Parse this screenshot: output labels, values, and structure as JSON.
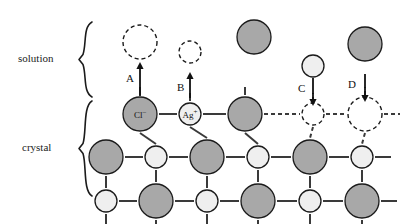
{
  "figure": {
    "background_color": "#ffffff",
    "regions": [
      {
        "id": "solution",
        "label": "solution",
        "label_x": 18,
        "label_y": 52,
        "brace_top": 22,
        "brace_bottom": 97,
        "brace_x": 92
      },
      {
        "id": "crystal",
        "label": "crystal",
        "label_x": 22,
        "label_y": 141,
        "brace_top": 101,
        "brace_bottom": 196,
        "brace_x": 92
      }
    ],
    "colors": {
      "anion_fill": "#a8a8a8",
      "cation_fill": "#efefef",
      "outline": "#1b1b1b",
      "bond": "#3a3a3a",
      "arrow": "#111111",
      "label_text": "#1b1b1b"
    },
    "ion_types": {
      "anion": {
        "name": "chloride",
        "formula": "Cl",
        "charge": "−",
        "radius": 17,
        "fill": "#a8a8a8"
      },
      "cation": {
        "name": "silver",
        "formula": "Ag",
        "charge": "+",
        "radius": 11,
        "fill": "#efefef"
      }
    },
    "ion_labels": [
      {
        "text_main": "Cl",
        "text_sup": "–",
        "x": 140,
        "y": 114
      },
      {
        "text_main": "Ag",
        "text_sup": "+",
        "x": 190,
        "y": 114
      }
    ],
    "arrows": [
      {
        "id": "A",
        "label": "A",
        "direction": "up",
        "x": 140,
        "y_from": 96,
        "y_to": 62,
        "label_x": 126,
        "label_y": 72
      },
      {
        "id": "B",
        "label": "B",
        "direction": "up",
        "x": 190,
        "y_from": 98,
        "y_to": 72,
        "label_x": 177,
        "label_y": 81
      },
      {
        "id": "C",
        "label": "C",
        "direction": "down",
        "x": 313,
        "y_from": 78,
        "y_to": 106,
        "label_x": 298,
        "label_y": 82
      },
      {
        "id": "D",
        "label": "D",
        "direction": "down",
        "x": 365,
        "y_from": 74,
        "y_to": 102,
        "label_x": 348,
        "label_y": 78
      }
    ],
    "solution_particles": [
      {
        "id": "a-target",
        "type": "anion",
        "cx": 140,
        "cy": 42,
        "style": "dashed",
        "r": 17
      },
      {
        "id": "b-target",
        "type": "cation",
        "cx": 190,
        "cy": 52,
        "style": "dashed",
        "r": 11
      },
      {
        "id": "free-anion",
        "type": "anion",
        "cx": 254,
        "cy": 37,
        "style": "solid",
        "r": 17
      },
      {
        "id": "c-source",
        "type": "cation",
        "cx": 313,
        "cy": 66,
        "style": "solid",
        "r": 11
      },
      {
        "id": "d-source",
        "type": "anion",
        "cx": 365,
        "cy": 44,
        "style": "solid",
        "r": 17
      }
    ],
    "lattice": {
      "rows": [
        {
          "y": 114,
          "sites": [
            {
              "col": 0,
              "x": 140,
              "type": "anion",
              "style": "solid"
            },
            {
              "col": 1,
              "x": 190,
              "type": "cation",
              "style": "solid"
            },
            {
              "col": 2,
              "x": 245,
              "type": "anion",
              "style": "solid"
            },
            {
              "col": 3,
              "x": 313,
              "type": "cation",
              "style": "dashed"
            },
            {
              "col": 4,
              "x": 365,
              "type": "anion",
              "style": "dashed"
            }
          ]
        },
        {
          "y": 157,
          "sites": [
            {
              "col": -1,
              "x": 106,
              "type": "anion",
              "style": "solid"
            },
            {
              "col": 0,
              "x": 156,
              "type": "cation",
              "style": "solid"
            },
            {
              "col": 1,
              "x": 207,
              "type": "anion",
              "style": "solid"
            },
            {
              "col": 2,
              "x": 258,
              "type": "cation",
              "style": "solid"
            },
            {
              "col": 3,
              "x": 310,
              "type": "anion",
              "style": "solid"
            },
            {
              "col": 4,
              "x": 362,
              "type": "cation",
              "style": "solid"
            }
          ]
        },
        {
          "y": 201,
          "sites": [
            {
              "col": -1,
              "x": 106,
              "type": "cation",
              "style": "solid"
            },
            {
              "col": 0,
              "x": 156,
              "type": "anion",
              "style": "solid"
            },
            {
              "col": 1,
              "x": 207,
              "type": "cation",
              "style": "solid"
            },
            {
              "col": 2,
              "x": 258,
              "type": "anion",
              "style": "solid"
            },
            {
              "col": 3,
              "x": 310,
              "type": "cation",
              "style": "solid"
            },
            {
              "col": 4,
              "x": 362,
              "type": "anion",
              "style": "solid"
            }
          ]
        }
      ]
    }
  }
}
